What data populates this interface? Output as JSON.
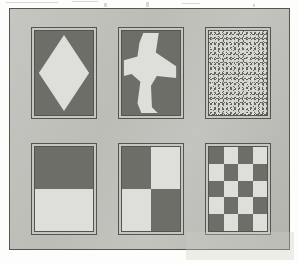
{
  "figure": {
    "plate_background_color": "#bdbdb8",
    "plate_border_color": "#55554f",
    "page_background_color": "#fdfdfb",
    "panel_mat_color": "#c6c6c0",
    "panel_border_color": "#55554f",
    "dark_color": "#6e6e68",
    "light_color": "#dededa",
    "grid": {
      "rows": 2,
      "columns": 3
    }
  },
  "panels": [
    {
      "index": 1,
      "position": "top-left",
      "name": "diamond",
      "label": "Diamond",
      "pattern_type": "shape",
      "description": "Light diamond (rhombus) centered on a dark field",
      "figure_fill": "#dededa",
      "field_fill": "#6e6e68"
    },
    {
      "index": 2,
      "position": "top-center",
      "name": "airplane",
      "label": "Airplane",
      "pattern_type": "shape",
      "description": "Light airplane silhouette on a dark field",
      "figure_fill": "#dededa",
      "field_fill": "#6e6e68"
    },
    {
      "index": 3,
      "position": "top-right",
      "name": "noise",
      "label": "Random noise",
      "pattern_type": "texture",
      "description": "Fine random speckle texture filling the field",
      "figure_fill": "#dededa",
      "field_fill": "#6e6e68"
    },
    {
      "index": 4,
      "position": "bottom-left",
      "name": "horizontal-split",
      "label": "Horizontal split",
      "pattern_type": "split",
      "description": "Dark upper half over light lower half",
      "rows": 2,
      "columns": 1,
      "cells": [
        "dark",
        "light"
      ],
      "figure_fill": "#dededa",
      "field_fill": "#6e6e68"
    },
    {
      "index": 5,
      "position": "bottom-center",
      "name": "checkerboard-2x2",
      "label": "2 x 2 checkerboard",
      "pattern_type": "checkerboard",
      "rows": 2,
      "columns": 2,
      "cells": [
        "dark",
        "light",
        "light",
        "dark"
      ],
      "figure_fill": "#dededa",
      "field_fill": "#6e6e68"
    },
    {
      "index": 6,
      "position": "bottom-right",
      "name": "checkerboard-4x5",
      "label": "4 x 5 checkerboard",
      "pattern_type": "checkerboard",
      "rows": 5,
      "columns": 4,
      "cells": [
        "dark",
        "light",
        "dark",
        "light",
        "light",
        "dark",
        "light",
        "dark",
        "dark",
        "light",
        "dark",
        "light",
        "light",
        "dark",
        "light",
        "dark",
        "dark",
        "light",
        "dark",
        "light"
      ],
      "figure_fill": "#dededa",
      "field_fill": "#6e6e68"
    }
  ]
}
